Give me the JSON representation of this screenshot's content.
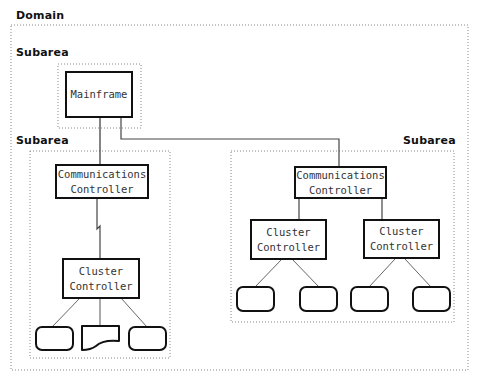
{
  "diagram": {
    "domain_label": "Domain",
    "subareas": [
      {
        "label": "Subarea",
        "position": "top-left (mainframe)"
      },
      {
        "label": "Subarea",
        "position": "left"
      },
      {
        "label": "Subarea",
        "position": "right"
      }
    ],
    "nodes": {
      "mainframe": "Mainframe",
      "left_comm_controller": "Communications\nController",
      "left_cluster_controller": "Cluster\nController",
      "right_comm_controller": "Communications\nController",
      "right_cluster_controller_1": "Cluster\nController",
      "right_cluster_controller_2": "Cluster\nController"
    },
    "devices": {
      "left": [
        "terminal",
        "document",
        "terminal"
      ],
      "right_cluster_1": [
        "terminal",
        "terminal"
      ],
      "right_cluster_2": [
        "terminal",
        "terminal"
      ]
    },
    "links": [
      {
        "from": "mainframe",
        "to": "left_comm_controller",
        "type": "channel"
      },
      {
        "from": "mainframe",
        "to": "right_comm_controller",
        "type": "channel"
      },
      {
        "from": "left_comm_controller",
        "to": "left_cluster_controller",
        "type": "telecommunication (lightning)"
      },
      {
        "from": "right_comm_controller",
        "to": "right_cluster_controller_1",
        "type": "channel"
      },
      {
        "from": "right_comm_controller",
        "to": "right_cluster_controller_2",
        "type": "channel"
      }
    ],
    "colors": {
      "line": "#111111",
      "dotted_border": "#888888",
      "connector": "#666666",
      "background": "#ffffff"
    }
  }
}
